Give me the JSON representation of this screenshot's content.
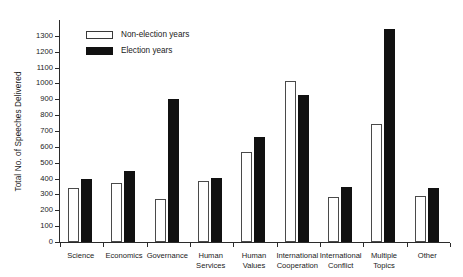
{
  "chart_data": {
    "type": "bar",
    "title": "",
    "xlabel": "",
    "ylabel": "Total No. of Speeches Delivered",
    "ylim": [
      0,
      1400
    ],
    "ytick_step": 100,
    "grid": false,
    "legend_position": "upper-left-inside",
    "categories": [
      "Science",
      "Economics",
      "Governance",
      "Human\nServices",
      "Human\nValues",
      "International\nCooperation",
      "International\nConflict",
      "Multiple\nTopics",
      "Other"
    ],
    "ytick_labels": [
      "0",
      "100",
      "200",
      "300",
      "400",
      "500",
      "600",
      "700",
      "800",
      "900",
      "1000",
      "1100",
      "1200",
      "1300"
    ],
    "ytick_values": [
      0,
      100,
      200,
      300,
      400,
      500,
      600,
      700,
      800,
      900,
      1000,
      1100,
      1200,
      1300
    ],
    "series": [
      {
        "name": "Non-election years",
        "color": "#ffffff",
        "edge_color": "#4a4a4a",
        "values": [
          340,
          370,
          270,
          385,
          570,
          1015,
          285,
          745,
          290
        ]
      },
      {
        "name": "Election years",
        "color": "#111111",
        "edge_color": "#111111",
        "values": [
          395,
          450,
          900,
          405,
          660,
          925,
          345,
          1345,
          340
        ]
      }
    ]
  },
  "legend": {
    "items": [
      {
        "label": "Non-election years",
        "style": "nonelection"
      },
      {
        "label": "Election years",
        "style": "election"
      }
    ]
  },
  "colors": {
    "axis": "#2b2b2b",
    "text": "#1a1a1a",
    "election_fill": "#111111",
    "nonelection_fill": "#ffffff"
  }
}
